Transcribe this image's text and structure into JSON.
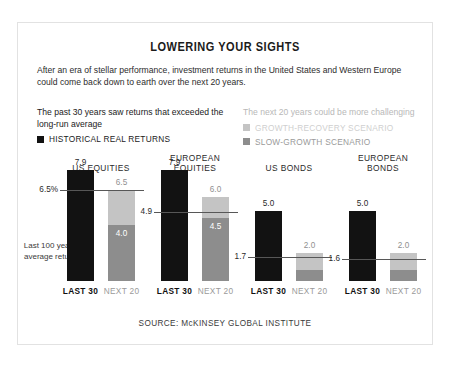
{
  "card": {
    "title": "LOWERING YOUR SIGHTS",
    "deck": "After an era of stellar performance, investment returns in the United States and Western Europe could come back down to earth over the next 20 years.",
    "source": "SOURCE: McKINSEY GLOBAL INSTITUTE"
  },
  "legend": {
    "left_heading": "The past 30 years saw returns that exceeded the long-run average",
    "right_heading": "The next 20 years could be more challenging",
    "items": [
      {
        "label": "HISTORICAL REAL RETURNS",
        "color": "#121212"
      },
      {
        "label": "GROWTH-RECOVERY SCENARIO",
        "color": "#c4c4c4"
      },
      {
        "label": "SLOW-GROWTH SCENARIO",
        "color": "#8d8d8d"
      }
    ]
  },
  "axis_note": "Last 100 years average return",
  "chart_data": {
    "type": "bar",
    "title": "LOWERING YOUR SIGHTS",
    "subtitle": "After an era of stellar performance, investment returns in the United States and Western Europe could come back down to earth over the next 20 years.",
    "xlabel": "",
    "ylabel": "Annual real return (%)",
    "ylim": [
      0,
      9
    ],
    "grid": false,
    "legend_position": "top",
    "categories": [
      "US EQUITIES",
      "EUROPEAN EQUITIES",
      "US BONDS",
      "EUROPEAN BONDS"
    ],
    "bar_labels": [
      "LAST 30",
      "NEXT 20"
    ],
    "series": [
      {
        "name": "HISTORICAL REAL RETURNS",
        "color": "#121212",
        "values": [
          7.9,
          7.9,
          5.0,
          5.0
        ]
      },
      {
        "name": "GROWTH-RECOVERY SCENARIO",
        "color": "#c4c4c4",
        "values": [
          6.5,
          6.0,
          2.0,
          2.0
        ]
      },
      {
        "name": "SLOW-GROWTH SCENARIO",
        "color": "#8d8d8d",
        "values": [
          4.0,
          4.5,
          0.8,
          0.8
        ]
      }
    ],
    "reference_lines": [
      {
        "category": "US EQUITIES",
        "label": "6.5%",
        "value": 6.5
      },
      {
        "category": "EUROPEAN EQUITIES",
        "label": "4.9",
        "value": 4.9
      },
      {
        "category": "US BONDS",
        "label": "1.7",
        "value": 1.7
      },
      {
        "category": "EUROPEAN BONDS",
        "label": "1.6",
        "value": 1.6
      }
    ],
    "groups": [
      {
        "name": "US EQUITIES",
        "title_lines": "US EQUITIES",
        "ref_label": "6.5%",
        "ref_value": 6.5,
        "last30": {
          "label": "7.9",
          "value": 7.9
        },
        "next20": {
          "top_label": "6.5",
          "top_value": 6.5,
          "inner_label": "4.0",
          "inner_value": 4.0
        }
      },
      {
        "name": "EUROPEAN EQUITIES",
        "title_lines": "EUROPEAN\nEQUITIES",
        "ref_label": "4.9",
        "ref_value": 4.9,
        "last30": {
          "label": "7.9",
          "value": 7.9
        },
        "next20": {
          "top_label": "6.0",
          "top_value": 6.0,
          "inner_label": "4.5",
          "inner_value": 4.5
        }
      },
      {
        "name": "US BONDS",
        "title_lines": "US BONDS",
        "ref_label": "1.7",
        "ref_value": 1.7,
        "last30": {
          "label": "5.0",
          "value": 5.0
        },
        "next20": {
          "top_label": "2.0",
          "top_value": 2.0,
          "inner_label": "",
          "inner_value": 0.8
        }
      },
      {
        "name": "EUROPEAN BONDS",
        "title_lines": "EUROPEAN\nBONDS",
        "ref_label": "1.6",
        "ref_value": 1.6,
        "last30": {
          "label": "5.0",
          "value": 5.0
        },
        "next20": {
          "top_label": "2.0",
          "top_value": 2.0,
          "inner_label": "",
          "inner_value": 0.8
        }
      }
    ]
  }
}
